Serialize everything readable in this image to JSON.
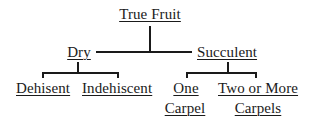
{
  "diagram": {
    "type": "tree",
    "root": {
      "label": "True Fruit",
      "children": [
        {
          "label": "Dry",
          "children": [
            {
              "label": "Dehisent"
            },
            {
              "label": "Indehiscent"
            }
          ]
        },
        {
          "label": "Succulent",
          "children": [
            {
              "label_line1": "One",
              "label_line2": "Carpel"
            },
            {
              "label_line1": "Two or More",
              "label_line2": "Carpels"
            }
          ]
        }
      ]
    },
    "colors": {
      "line": "#1a1a1a",
      "text": "#1a1a1a",
      "background": "#ffffff"
    }
  }
}
